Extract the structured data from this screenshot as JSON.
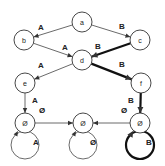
{
  "diagram": {
    "type": "state-transition-graph",
    "nodes": [
      {
        "id": "a",
        "label": "a"
      },
      {
        "id": "b",
        "label": "b"
      },
      {
        "id": "c",
        "label": "c"
      },
      {
        "id": "d",
        "label": "d"
      },
      {
        "id": "e",
        "label": "e"
      },
      {
        "id": "f",
        "label": "f"
      },
      {
        "id": "sinkA",
        "label": "Ø"
      },
      {
        "id": "sinkMid",
        "label": "Ø"
      },
      {
        "id": "sinkB",
        "label": "Ø"
      }
    ],
    "edges": [
      {
        "from": "a",
        "to": "b",
        "label": "A",
        "bold": false
      },
      {
        "from": "a",
        "to": "c",
        "label": "B",
        "bold": false
      },
      {
        "from": "b",
        "to": "d",
        "label": "A",
        "bold": false
      },
      {
        "from": "c",
        "to": "d",
        "label": "B",
        "bold": true
      },
      {
        "from": "d",
        "to": "e",
        "label": "A",
        "bold": false
      },
      {
        "from": "d",
        "to": "f",
        "label": "B",
        "bold": true
      },
      {
        "from": "e",
        "to": "sinkA",
        "label": "A",
        "bold": false
      },
      {
        "from": "f",
        "to": "sinkB",
        "label": "B",
        "bold": true
      },
      {
        "from": "sinkA",
        "to": "sinkMid",
        "label": "Ø",
        "bold": false
      },
      {
        "from": "sinkB",
        "to": "sinkMid",
        "label": "Ø",
        "bold": false
      },
      {
        "from": "sinkA",
        "to": "sinkA",
        "label": "A",
        "bold": false,
        "self_loop": true
      },
      {
        "from": "sinkMid",
        "to": "sinkMid",
        "label": "Ø",
        "bold": false,
        "self_loop": true
      },
      {
        "from": "sinkB",
        "to": "sinkB",
        "label": "B",
        "bold": true,
        "self_loop": true
      }
    ]
  }
}
